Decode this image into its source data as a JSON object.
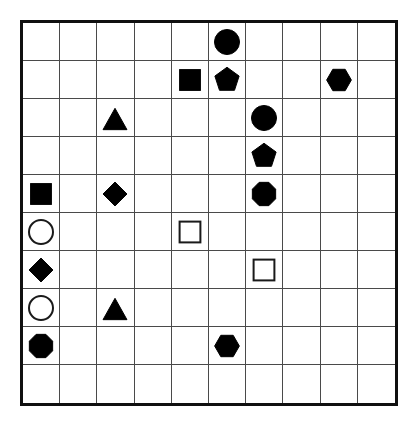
{
  "canvas": {
    "width": 419,
    "height": 428,
    "background_color": "#ffffff"
  },
  "grid": {
    "rows": 10,
    "columns": 10,
    "origin_x": 20,
    "origin_y": 20,
    "width": 378,
    "height": 386,
    "cell_width": 37.8,
    "cell_height": 38.6,
    "outer_border_color": "#101010",
    "outer_border_width": 3,
    "inner_line_color": "#4a4a4a",
    "inner_line_width": 1
  },
  "style": {
    "fill_color": "#000000",
    "outline_color": "#1a1a1a",
    "outline_width": 2,
    "shape_size": 26
  },
  "legend": {
    "shape_kinds": [
      "circle",
      "square",
      "triangle",
      "diamond",
      "pentagon",
      "hexagon",
      "octagon"
    ],
    "fill_kinds": [
      "filled",
      "open"
    ]
  },
  "shapes": [
    {
      "id": "s1",
      "row": 1,
      "col": 6,
      "shape": "circle",
      "fill": "filled",
      "name": "filled-circle"
    },
    {
      "id": "s2",
      "row": 2,
      "col": 5,
      "shape": "square",
      "fill": "filled",
      "name": "filled-square"
    },
    {
      "id": "s3",
      "row": 2,
      "col": 6,
      "shape": "pentagon",
      "fill": "filled",
      "name": "filled-pentagon"
    },
    {
      "id": "s4",
      "row": 2,
      "col": 9,
      "shape": "hexagon",
      "fill": "filled",
      "name": "filled-hexagon"
    },
    {
      "id": "s5",
      "row": 3,
      "col": 3,
      "shape": "triangle",
      "fill": "filled",
      "name": "filled-triangle"
    },
    {
      "id": "s6",
      "row": 3,
      "col": 7,
      "shape": "circle",
      "fill": "filled",
      "name": "filled-circle"
    },
    {
      "id": "s7",
      "row": 4,
      "col": 7,
      "shape": "pentagon",
      "fill": "filled",
      "name": "filled-pentagon"
    },
    {
      "id": "s8",
      "row": 5,
      "col": 1,
      "shape": "square",
      "fill": "filled",
      "name": "filled-square"
    },
    {
      "id": "s9",
      "row": 5,
      "col": 3,
      "shape": "diamond",
      "fill": "filled",
      "name": "filled-diamond"
    },
    {
      "id": "s10",
      "row": 5,
      "col": 7,
      "shape": "octagon",
      "fill": "filled",
      "name": "filled-octagon"
    },
    {
      "id": "s11",
      "row": 6,
      "col": 1,
      "shape": "circle",
      "fill": "open",
      "name": "open-circle"
    },
    {
      "id": "s12",
      "row": 6,
      "col": 5,
      "shape": "square",
      "fill": "open",
      "name": "open-square"
    },
    {
      "id": "s13",
      "row": 7,
      "col": 1,
      "shape": "diamond",
      "fill": "filled",
      "name": "filled-diamond"
    },
    {
      "id": "s14",
      "row": 7,
      "col": 7,
      "shape": "square",
      "fill": "open",
      "name": "open-square"
    },
    {
      "id": "s15",
      "row": 8,
      "col": 1,
      "shape": "circle",
      "fill": "open",
      "name": "open-circle"
    },
    {
      "id": "s16",
      "row": 8,
      "col": 3,
      "shape": "triangle",
      "fill": "filled",
      "name": "filled-triangle"
    },
    {
      "id": "s17",
      "row": 9,
      "col": 1,
      "shape": "octagon",
      "fill": "filled",
      "name": "filled-octagon"
    },
    {
      "id": "s18",
      "row": 9,
      "col": 6,
      "shape": "hexagon",
      "fill": "filled",
      "name": "filled-hexagon"
    }
  ],
  "counts": {
    "total_shapes": 18,
    "filled": 15,
    "open": 3,
    "empty_cells": 82
  }
}
